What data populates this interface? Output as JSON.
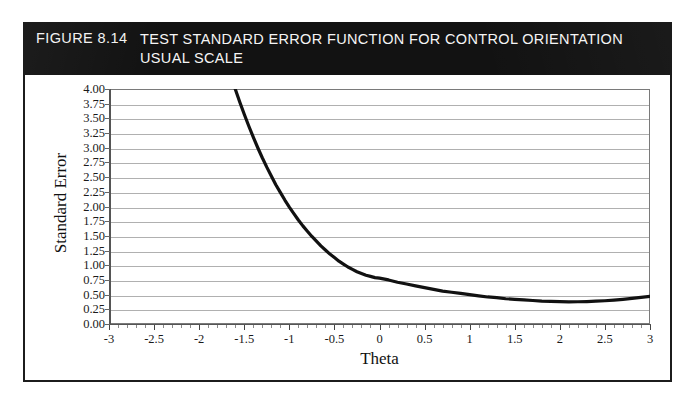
{
  "figure": {
    "number": "FIGURE 8.14",
    "title_line1": "TEST STANDARD ERROR FUNCTION FOR CONTROL ORIENTATION",
    "title_line2": "USUAL SCALE",
    "band_color": "#121212",
    "band_text_color": "#f5f5f5"
  },
  "chart_data": {
    "type": "line",
    "title": "TEST STANDARD ERROR FUNCTION FOR CONTROL ORIENTATION USUAL SCALE",
    "subtitle": "",
    "xlabel": "Theta",
    "ylabel": "Standard Error",
    "xlim": [
      -3,
      3
    ],
    "ylim": [
      0.0,
      4.0
    ],
    "xticks": [
      -3,
      -2.5,
      -2,
      -1.5,
      -1,
      -0.5,
      0,
      0.5,
      1,
      1.5,
      2,
      2.5,
      3
    ],
    "xtick_labels": [
      "-3",
      "-2.5",
      "-2",
      "-1.5",
      "-1",
      "-0.5",
      "0",
      "0.5",
      "1",
      "1.5",
      "2",
      "2.5",
      "3"
    ],
    "yticks": [
      0.0,
      0.25,
      0.5,
      0.75,
      1.0,
      1.25,
      1.5,
      1.75,
      2.0,
      2.25,
      2.5,
      2.75,
      3.0,
      3.25,
      3.5,
      3.75,
      4.0
    ],
    "ytick_labels": [
      "0.00",
      "0.25",
      "0.50",
      "0.75",
      "1.00",
      "1.25",
      "1.50",
      "1.75",
      "2.00",
      "2.25",
      "2.50",
      "2.75",
      "3.00",
      "3.25",
      "3.50",
      "3.75",
      "4.00"
    ],
    "grid": "horizontal",
    "grid_color": "#b0b0b0",
    "legend": "none",
    "line_color": "#111111",
    "line_width": 3.2,
    "series": [
      {
        "name": "Standard Error",
        "x": [
          -1.6,
          -1.55,
          -1.5,
          -1.45,
          -1.4,
          -1.35,
          -1.3,
          -1.25,
          -1.2,
          -1.15,
          -1.1,
          -1.05,
          -1.0,
          -0.95,
          -0.9,
          -0.85,
          -0.8,
          -0.75,
          -0.7,
          -0.65,
          -0.6,
          -0.55,
          -0.5,
          -0.45,
          -0.4,
          -0.35,
          -0.3,
          -0.25,
          -0.2,
          -0.15,
          -0.1,
          -0.05,
          0.0,
          0.1,
          0.2,
          0.3,
          0.4,
          0.5,
          0.6,
          0.7,
          0.8,
          0.9,
          1.0,
          1.1,
          1.2,
          1.3,
          1.4,
          1.5,
          1.6,
          1.7,
          1.8,
          1.9,
          2.0,
          2.1,
          2.2,
          2.3,
          2.4,
          2.5,
          2.6,
          2.7,
          2.8,
          2.9,
          3.0
        ],
        "y": [
          4.0,
          3.78,
          3.57,
          3.37,
          3.18,
          3.0,
          2.83,
          2.67,
          2.52,
          2.37,
          2.24,
          2.11,
          1.99,
          1.88,
          1.77,
          1.67,
          1.58,
          1.49,
          1.41,
          1.33,
          1.26,
          1.19,
          1.13,
          1.07,
          1.02,
          0.97,
          0.93,
          0.89,
          0.86,
          0.83,
          0.81,
          0.79,
          0.78,
          0.75,
          0.71,
          0.68,
          0.65,
          0.62,
          0.59,
          0.56,
          0.54,
          0.52,
          0.5,
          0.48,
          0.46,
          0.45,
          0.43,
          0.42,
          0.41,
          0.4,
          0.39,
          0.385,
          0.38,
          0.378,
          0.379,
          0.382,
          0.388,
          0.396,
          0.407,
          0.42,
          0.435,
          0.452,
          0.47
        ]
      }
    ]
  }
}
